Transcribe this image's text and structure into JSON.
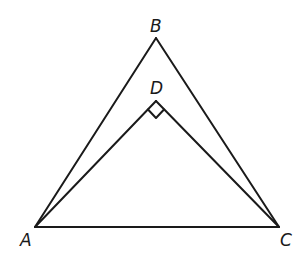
{
  "diagram": {
    "type": "geometry",
    "stroke_color": "#1a1a1a",
    "points": {
      "A": {
        "label": "A",
        "x": 35,
        "y": 227
      },
      "B": {
        "label": "B",
        "x": 156,
        "y": 38
      },
      "C": {
        "label": "C",
        "x": 279,
        "y": 227
      },
      "D": {
        "label": "D",
        "x": 156,
        "y": 101
      }
    },
    "segments": [
      [
        "A",
        "B"
      ],
      [
        "B",
        "C"
      ],
      [
        "A",
        "C"
      ],
      [
        "A",
        "D"
      ],
      [
        "D",
        "C"
      ]
    ],
    "right_angle_marker": {
      "at": "D",
      "size": 11
    }
  }
}
